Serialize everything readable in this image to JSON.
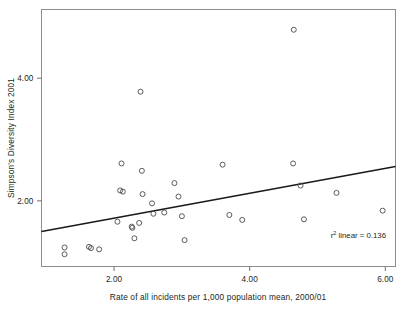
{
  "chart_data": {
    "type": "scatter",
    "title": "",
    "xlabel": "Rate of all incidents per 1,000 population mean, 2000/01",
    "ylabel": "Simpson's Diversity Index 2001",
    "xlim": [
      0.93,
      6.15
    ],
    "ylim": [
      0.93,
      5.12
    ],
    "xticks": [
      2.0,
      4.0,
      6.0
    ],
    "xticklabels": [
      "2.00",
      "4.00",
      "6.00"
    ],
    "yticks": [
      2.0,
      4.0
    ],
    "yticklabels": [
      "2.00",
      "4.00"
    ],
    "grid": false,
    "legend": null,
    "marker_style": "open-circle",
    "points": [
      {
        "x": 1.27,
        "y": 1.24
      },
      {
        "x": 1.27,
        "y": 1.13
      },
      {
        "x": 1.63,
        "y": 1.25
      },
      {
        "x": 1.66,
        "y": 1.23
      },
      {
        "x": 1.78,
        "y": 1.21
      },
      {
        "x": 2.05,
        "y": 1.66
      },
      {
        "x": 2.09,
        "y": 2.17
      },
      {
        "x": 2.11,
        "y": 2.61
      },
      {
        "x": 2.13,
        "y": 2.15
      },
      {
        "x": 2.26,
        "y": 1.58
      },
      {
        "x": 2.27,
        "y": 1.56
      },
      {
        "x": 2.3,
        "y": 1.39
      },
      {
        "x": 2.37,
        "y": 1.64
      },
      {
        "x": 2.39,
        "y": 3.78
      },
      {
        "x": 2.41,
        "y": 2.49
      },
      {
        "x": 2.42,
        "y": 2.11
      },
      {
        "x": 2.56,
        "y": 1.96
      },
      {
        "x": 2.58,
        "y": 1.79
      },
      {
        "x": 2.74,
        "y": 1.81
      },
      {
        "x": 2.89,
        "y": 2.29
      },
      {
        "x": 2.95,
        "y": 2.07
      },
      {
        "x": 3.0,
        "y": 1.75
      },
      {
        "x": 3.04,
        "y": 1.36
      },
      {
        "x": 3.6,
        "y": 2.59
      },
      {
        "x": 3.7,
        "y": 1.77
      },
      {
        "x": 3.89,
        "y": 1.69
      },
      {
        "x": 4.65,
        "y": 4.79
      },
      {
        "x": 4.64,
        "y": 2.61
      },
      {
        "x": 4.75,
        "y": 2.25
      },
      {
        "x": 4.8,
        "y": 1.7
      },
      {
        "x": 5.28,
        "y": 2.13
      },
      {
        "x": 5.96,
        "y": 1.84
      }
    ],
    "fit_line": {
      "type": "linear",
      "x_start": 0.93,
      "y_start": 1.5,
      "x_end": 6.15,
      "y_end": 2.56
    },
    "annotation": {
      "prefix": "r",
      "superscript": "2",
      "suffix": " linear = 0.136"
    }
  },
  "colors": {
    "marker_stroke": "#4a4a4a",
    "fit_line": "#1a1a1a",
    "frame": "#8d8d8d",
    "text": "#231f20",
    "background": "#ffffff"
  }
}
